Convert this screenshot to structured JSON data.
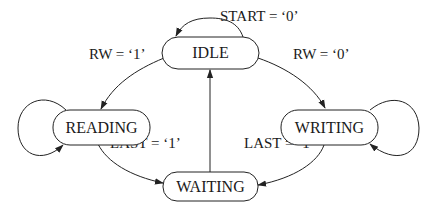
{
  "diagram": {
    "type": "state-machine",
    "nodes": {
      "idle": {
        "label": "IDLE"
      },
      "reading": {
        "label": "READING"
      },
      "writing": {
        "label": "WRITING"
      },
      "waiting": {
        "label": "WAITING"
      }
    },
    "edges": {
      "idle_self": {
        "from": "IDLE",
        "to": "IDLE",
        "label": "START = ‘0’"
      },
      "idle_to_reading": {
        "from": "IDLE",
        "to": "READING",
        "label": "RW = ‘1’"
      },
      "idle_to_writing": {
        "from": "IDLE",
        "to": "WRITING",
        "label": "RW = ‘0’"
      },
      "reading_self": {
        "from": "READING",
        "to": "READING",
        "label": ""
      },
      "writing_self": {
        "from": "WRITING",
        "to": "WRITING",
        "label": ""
      },
      "reading_to_waiting": {
        "from": "READING",
        "to": "WAITING",
        "label": "LAST = ‘1’"
      },
      "writing_to_waiting": {
        "from": "WRITING",
        "to": "WAITING",
        "label": "LAST = ‘1’"
      },
      "waiting_to_idle": {
        "from": "WAITING",
        "to": "IDLE",
        "label": ""
      }
    },
    "colors": {
      "stroke": "#222222",
      "text": "#1a1a1a",
      "background": "#ffffff"
    }
  }
}
